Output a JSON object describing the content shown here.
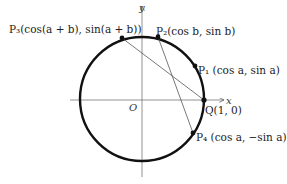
{
  "diagram": {
    "axes": {
      "x_label": "x",
      "y_label": "y",
      "origin_label": "O"
    },
    "circle": {
      "cx": 142,
      "cy": 99,
      "r": 62,
      "stroke": "#111111"
    },
    "points": [
      {
        "id": "P3",
        "label": "P₃(cos(a + b), sin(a + b))",
        "x": 122,
        "y": 38
      },
      {
        "id": "P2",
        "label": "P₂(cos b, sin b)",
        "x": 158,
        "y": 37
      },
      {
        "id": "P1",
        "label": "P₁ (cos a, sin a)",
        "x": 195,
        "y": 66
      },
      {
        "id": "Q",
        "label": "Q(1, 0)",
        "x": 204,
        "y": 100
      },
      {
        "id": "P4",
        "label": "P₄ (cos a, −sin a)",
        "x": 193,
        "y": 133
      }
    ],
    "segments": [
      {
        "from": "P3",
        "to": "Q"
      },
      {
        "from": "P2",
        "to": "P4"
      }
    ]
  }
}
